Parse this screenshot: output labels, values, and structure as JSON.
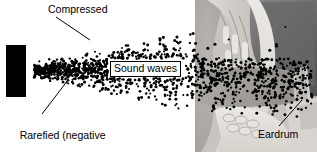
{
  "figure": {
    "width": 317,
    "height": 152,
    "background_color": "#ffffff",
    "text_color": "#000000",
    "dot_color": "#000000"
  },
  "labels": {
    "compressed": "Compressed",
    "rarefied_line1": "Rarefied (negative",
    "rarefied_line2": "pressure)",
    "sound_waves": "Sound waves",
    "eardrum": "Eardrum"
  },
  "elements": {
    "speaker_name": "loudspeaker",
    "ear_photo_name": "ear-canal-cross-section",
    "dot_field_name": "air-particle-dots"
  },
  "chart_data": {
    "type": "scatter",
    "xlabel": "",
    "ylabel": "",
    "annotations": [
      {
        "text": "Compressed",
        "x": 48,
        "y": 3,
        "leader_to": [
          90,
          38
        ]
      },
      {
        "text": "Rarefied (negative pressure)",
        "x": 8,
        "y": 117,
        "leader_to": [
          62,
          82
        ]
      },
      {
        "text": "Sound waves",
        "x": 110,
        "y": 61
      },
      {
        "text": "Eardrum",
        "x": 258,
        "y": 128,
        "leader_to": [
          299,
          101
        ]
      }
    ]
  }
}
